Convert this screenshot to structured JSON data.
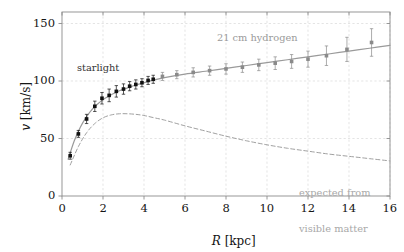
{
  "figure": {
    "background": "#ffffff",
    "plot_frame_color": "#808080"
  },
  "axes": {
    "x_title_var": "R",
    "x_title_unit": "[kpc]",
    "y_title_var": "v",
    "y_title_unit": "[km/s]",
    "x_ticks": [
      "0",
      "2",
      "4",
      "6",
      "8",
      "10",
      "12",
      "14",
      "16"
    ],
    "y_ticks": [
      "0",
      "50",
      "100",
      "150"
    ]
  },
  "annotations": {
    "starlight": "starlight",
    "hydrogen": "21 cm hydrogen",
    "expected_line1": "expected from",
    "expected_line2": "visible matter"
  },
  "colors": {
    "starlight_marker": "#111111",
    "hydrogen_marker": "#8a8a8a",
    "fit_curve": "#9a9a9a",
    "expected_curve": "#a0a0a0",
    "grid": "#d9d9d9",
    "frame": "#8c8c8c"
  },
  "chart_data": {
    "type": "scatter",
    "title": "",
    "xlabel": "R [kpc]",
    "ylabel": "v [km/s]",
    "xlim": [
      0,
      16
    ],
    "ylim": [
      0,
      160
    ],
    "xticks": [
      0,
      2,
      4,
      6,
      8,
      10,
      12,
      14,
      16
    ],
    "yticks": [
      0,
      50,
      100,
      150
    ],
    "grid": true,
    "legend": "annotations-inline",
    "series": [
      {
        "name": "starlight",
        "marker": "filled-square",
        "color": "#111111",
        "x": [
          0.4,
          0.8,
          1.2,
          1.6,
          1.95,
          2.3,
          2.65,
          3.0,
          3.3,
          3.6,
          3.9,
          4.2,
          4.45
        ],
        "y": [
          35.0,
          54.0,
          67.0,
          78.0,
          85.0,
          87.5,
          91.0,
          93.0,
          95.5,
          97.0,
          98.5,
          100.5,
          101.5
        ],
        "yerr": [
          3.0,
          3.0,
          4.0,
          4.5,
          5.0,
          5.5,
          5.0,
          4.5,
          4.0,
          4.0,
          3.5,
          3.5,
          3.5
        ]
      },
      {
        "name": "21 cm hydrogen",
        "marker": "filled-square",
        "color": "#8a8a8a",
        "x": [
          4.9,
          5.6,
          6.4,
          7.2,
          8.0,
          8.8,
          9.6,
          10.4,
          11.2,
          12.0,
          12.9,
          13.9,
          15.1
        ],
        "y": [
          104.0,
          105.5,
          107.5,
          109.0,
          110.5,
          112.0,
          114.0,
          115.5,
          117.0,
          119.0,
          122.0,
          127.5,
          133.5
        ],
        "yerr": [
          3.5,
          3.5,
          4.0,
          4.0,
          4.5,
          4.5,
          5.0,
          5.5,
          6.0,
          7.0,
          8.5,
          10.5,
          12.0
        ]
      }
    ],
    "curves": [
      {
        "name": "observed-fit",
        "style": "solid",
        "color": "#9a9a9a",
        "x": [
          0.3,
          0.6,
          0.9,
          1.2,
          1.5,
          1.8,
          2.1,
          2.4,
          2.8,
          3.2,
          3.6,
          4.0,
          4.5,
          5.0,
          6.0,
          7.0,
          8.0,
          9.0,
          10.0,
          11.0,
          12.0,
          13.0,
          14.0,
          15.0,
          16.0
        ],
        "y": [
          32.0,
          48.0,
          60.0,
          69.0,
          76.0,
          81.0,
          85.0,
          88.0,
          91.5,
          94.0,
          96.5,
          98.5,
          101.0,
          103.0,
          106.0,
          108.5,
          111.0,
          113.5,
          116.0,
          118.5,
          121.0,
          123.5,
          126.0,
          128.5,
          131.0
        ]
      },
      {
        "name": "expected-from-visible-matter",
        "style": "dashed",
        "color": "#a0a0a0",
        "x": [
          0.4,
          0.8,
          1.2,
          1.6,
          2.0,
          2.4,
          2.8,
          3.2,
          3.6,
          4.0,
          4.5,
          5.0,
          6.0,
          7.0,
          8.0,
          9.0,
          10.0,
          11.0,
          12.0,
          13.0,
          14.0,
          15.0,
          16.0
        ],
        "y": [
          27.0,
          43.0,
          55.0,
          63.0,
          68.0,
          70.5,
          71.5,
          71.5,
          71.0,
          70.0,
          68.0,
          66.0,
          61.0,
          56.5,
          52.0,
          48.0,
          44.5,
          41.5,
          39.0,
          36.5,
          34.5,
          32.5,
          30.5
        ]
      }
    ]
  },
  "geometry": {
    "plot_left": 62,
    "plot_right": 390,
    "plot_top": 12,
    "plot_bottom": 196,
    "x_min": 0,
    "x_max": 16,
    "y_min": 0,
    "y_max": 160
  },
  "label_positions": {
    "starlight": {
      "left": 77,
      "top": 63
    },
    "hydrogen": {
      "left": 217,
      "top": 33
    },
    "expected": {
      "left": 299,
      "top": 163
    }
  }
}
